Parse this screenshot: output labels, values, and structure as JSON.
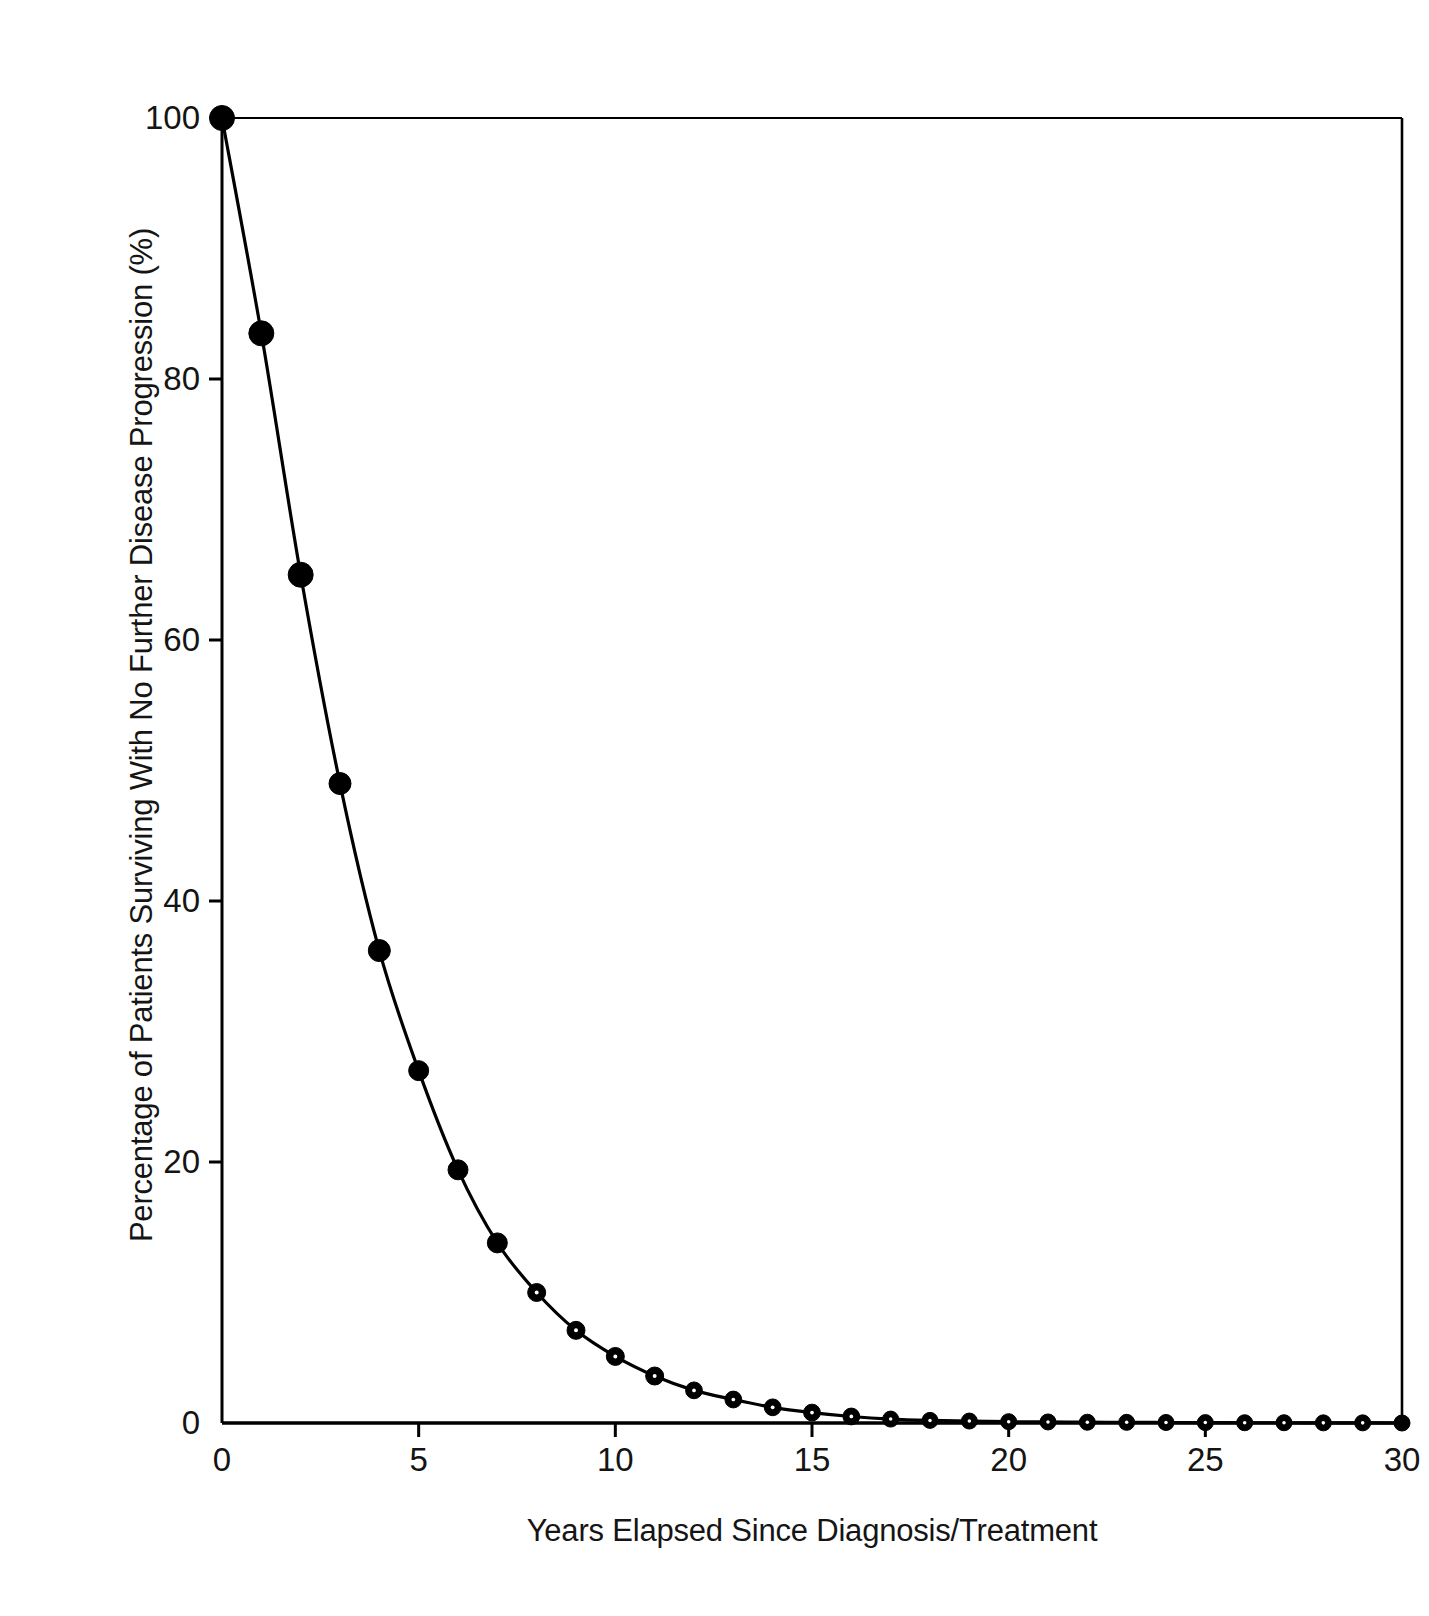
{
  "chart_data": {
    "type": "line",
    "title": "",
    "xlabel": "Years Elapsed Since Diagnosis/Treatment",
    "ylabel": "Percentage of Patients Surviving With No Further Disease Progression (%)",
    "xlim": [
      0,
      30
    ],
    "ylim": [
      0,
      100
    ],
    "grid": false,
    "legend": "none",
    "marker": "filled-circle",
    "line_color": "#000000",
    "marker_color": "#000000",
    "xticks": [
      0,
      5,
      10,
      15,
      20,
      25,
      30
    ],
    "xtick_labels": [
      "0",
      "5",
      "10",
      "15",
      "20",
      "25",
      "30"
    ],
    "yticks": [
      0,
      20,
      40,
      60,
      80,
      100
    ],
    "ytick_labels": [
      "0",
      "20",
      "40",
      "60",
      "80",
      "100"
    ],
    "x": [
      0,
      1,
      2,
      3,
      4,
      5,
      6,
      7,
      8,
      9,
      10,
      11,
      12,
      13,
      14,
      15,
      16,
      17,
      18,
      19,
      20,
      21,
      22,
      23,
      24,
      25,
      26,
      27,
      28,
      29,
      30
    ],
    "y": [
      100.0,
      83.5,
      65.0,
      49.0,
      36.2,
      27.0,
      19.4,
      13.8,
      10.0,
      7.1,
      5.1,
      3.6,
      2.5,
      1.8,
      1.2,
      0.8,
      0.5,
      0.3,
      0.2,
      0.15,
      0.1,
      0.08,
      0.06,
      0.05,
      0.04,
      0.03,
      0.02,
      0.02,
      0.01,
      0.01,
      0.0
    ],
    "series": [
      {
        "name": "Progression-free survival",
        "values": [
          100.0,
          83.5,
          65.0,
          49.0,
          36.2,
          27.0,
          19.4,
          13.8,
          10.0,
          7.1,
          5.1,
          3.6,
          2.5,
          1.8,
          1.2,
          0.8,
          0.5,
          0.3,
          0.2,
          0.15,
          0.1,
          0.08,
          0.06,
          0.05,
          0.04,
          0.03,
          0.02,
          0.02,
          0.01,
          0.01,
          0.0
        ]
      }
    ]
  },
  "axes": {
    "frame_color": "#000000",
    "background": "#ffffff"
  }
}
